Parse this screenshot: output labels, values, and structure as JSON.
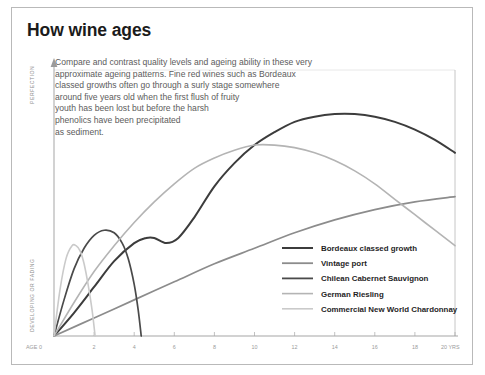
{
  "header": {
    "title": "How wine ages"
  },
  "intro": {
    "lines": [
      "Compare and contrast quality levels and ageing ability in these very",
      "approximate ageing patterns. Fine red wines such as Bordeaux",
      "classed growths often go through a surly stage somewhere",
      "around five years old when the first flush of fruity",
      "youth has been lost but before the harsh",
      "phenolics have been precipitated",
      "as sediment."
    ]
  },
  "chart_data": {
    "type": "line",
    "title": "How wine ages",
    "xlabel": "AGE",
    "ylabel": "PERFECTION / DEVELOPING OR FADING",
    "xlim": [
      0,
      20
    ],
    "ylim": [
      0,
      100
    ],
    "grid": false,
    "legend_position": "bottom-right",
    "x_axis": {
      "start_label": "AGE 0",
      "end_label": "20 YRS",
      "ticks": [
        0,
        2,
        4,
        6,
        8,
        10,
        12,
        14,
        16,
        18,
        20
      ],
      "tick_labels": [
        "0",
        "2",
        "4",
        "6",
        "8",
        "10",
        "12",
        "14",
        "16",
        "18",
        "20"
      ]
    },
    "y_axis": {
      "top_label": "PERFECTION",
      "bottom_label": "DEVELOPING OR FADING"
    },
    "series": [
      {
        "name": "Bordeaux classed growth",
        "color": "#3c3c3c",
        "width": 2.0,
        "x": [
          0,
          1,
          2,
          3,
          4,
          4.6,
          5,
          5.6,
          6.2,
          7,
          8,
          9,
          10,
          11,
          12,
          13,
          14,
          15,
          16,
          17,
          18,
          19,
          20
        ],
        "y": [
          0,
          9,
          19,
          29,
          36,
          38,
          38,
          36,
          38,
          46,
          58,
          67,
          74,
          79,
          83,
          85,
          86,
          86,
          85,
          83,
          80,
          76,
          71
        ]
      },
      {
        "name": "Vintage port",
        "color": "#8c8c8c",
        "width": 1.7,
        "x": [
          0,
          2,
          4,
          6,
          8,
          10,
          12,
          14,
          16,
          18,
          20
        ],
        "y": [
          0,
          7,
          14,
          21,
          28,
          34,
          40,
          45,
          49,
          52,
          54
        ]
      },
      {
        "name": "Chilean Cabernet Sauvignon",
        "color": "#4a4a4a",
        "width": 1.7,
        "x": [
          0,
          0.5,
          1,
          1.5,
          2,
          2.5,
          3,
          3.4,
          3.7,
          4,
          4.2,
          4.35
        ],
        "y": [
          0,
          14,
          26,
          34,
          39,
          41,
          40,
          36,
          30,
          20,
          10,
          0
        ]
      },
      {
        "name": "German Riesling",
        "color": "#b4b4b4",
        "width": 1.6,
        "x": [
          0,
          1,
          2,
          3,
          4,
          5,
          6,
          7,
          8,
          9,
          10,
          11,
          12,
          13,
          14,
          15,
          16,
          17,
          18,
          19,
          20
        ],
        "y": [
          0,
          13,
          25,
          35,
          44,
          52,
          59,
          65,
          69,
          72,
          74,
          74,
          73,
          71,
          68,
          64,
          59,
          53,
          47,
          41,
          35
        ]
      },
      {
        "name": "Commercial New World Chardonnay",
        "color": "#cacaca",
        "width": 1.6,
        "x": [
          0,
          0.3,
          0.6,
          0.9,
          1.1,
          1.3,
          1.5,
          1.7,
          1.9,
          2.05
        ],
        "y": [
          0,
          18,
          30,
          35,
          35,
          33,
          28,
          20,
          10,
          0
        ]
      }
    ]
  },
  "legend": {
    "items": [
      {
        "label": "Bordeaux classed growth",
        "color": "#3c3c3c",
        "width": 2.0
      },
      {
        "label": "Vintage port",
        "color": "#8c8c8c",
        "width": 1.8
      },
      {
        "label": "Chilean Cabernet Sauvignon",
        "color": "#4a4a4a",
        "width": 1.8
      },
      {
        "label": "German Riesling",
        "color": "#b4b4b4",
        "width": 1.6
      },
      {
        "label": "Commercial New World Chardonnay",
        "color": "#cacaca",
        "width": 1.6
      }
    ]
  }
}
